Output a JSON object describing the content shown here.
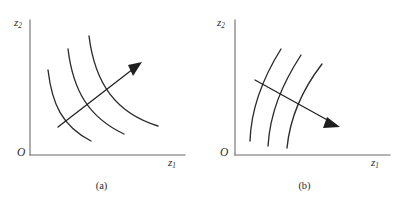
{
  "figure": {
    "background_color": "#ffffff",
    "curve_color": "#2b2b2b",
    "axis_color": "#6b6b6b",
    "arrow_color": "#1f1f1f"
  },
  "panels": [
    {
      "id": "a",
      "caption": "(a)",
      "origin_label": "O",
      "y_axis_label_base": "z",
      "y_axis_label_sub": "2",
      "x_axis_label_base": "z",
      "x_axis_label_sub": "1",
      "curve_shape": "convex-to-origin",
      "curve_count": 3,
      "arrow_direction": "up-right",
      "arrow_meaning": "direction of increase",
      "curves": [
        "M 48,70 C 52,104 62,126 91,141",
        "M 68,49 C 73,90 88,117 124,134",
        "M 89,36 C 95,84 116,113 158,126"
      ],
      "arrow_line": "M 58,127 L 133,69",
      "arrow_head": "M 142,62 L 128,65 L 133,76 Z",
      "axis_y": "M 30,20 L 30,155",
      "axis_x": "M 30,155 L 185,155"
    },
    {
      "id": "b",
      "caption": "(b)",
      "origin_label": "O",
      "y_axis_label_base": "z",
      "y_axis_label_sub": "2",
      "x_axis_label_base": "z",
      "x_axis_label_sub": "1",
      "curve_shape": "concave-rising",
      "curve_count": 3,
      "arrow_direction": "down-right",
      "arrow_meaning": "direction of increase",
      "curves": [
        "M 47,141 C 48,110 58,81 78,49",
        "M 65,146 C 67,114 78,86 98,55",
        "M 84,148 C 87,117 99,90 119,64"
      ],
      "arrow_line": "M 52,80 L 128,122",
      "arrow_head": "M 137,127 L 124,117 L 120,128 Z",
      "axis_y": "M 32,20 L 32,155",
      "axis_x": "M 32,155 L 187,155"
    }
  ]
}
